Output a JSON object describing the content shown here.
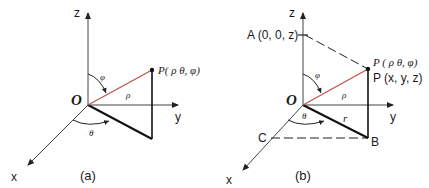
{
  "colors": {
    "axis": "#333333",
    "line": "#111111",
    "radius": "#c0504d",
    "background": "#ffffff"
  },
  "panel_a": {
    "caption": "(a)",
    "axis_labels": {
      "x": "x",
      "y": "y",
      "z": "z"
    },
    "origin_label": "O",
    "point_label": "P( ρ θ, φ)",
    "rho_label": "ρ",
    "phi_label": "φ",
    "theta_label": "θ"
  },
  "panel_b": {
    "caption": "(b)",
    "axis_labels": {
      "x": "x",
      "y": "y",
      "z": "z"
    },
    "origin_label": "O",
    "point_label_spherical": "P ( ρ θ, φ)",
    "point_label_cartesian": "P (x, y, z)",
    "A_label": "A (0, 0, z)",
    "B_label": "B",
    "C_label": "C",
    "rho_label": "ρ",
    "r_label": "r",
    "phi_label": "φ",
    "theta_label": "θ"
  }
}
